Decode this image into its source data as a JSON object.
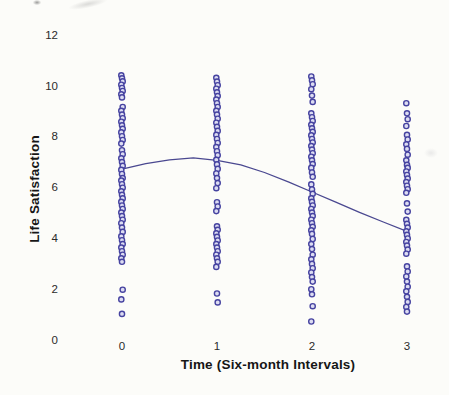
{
  "chart_data": {
    "type": "scatter",
    "title": "",
    "xlabel": "Time (Six-month Intervals)",
    "ylabel": "Life Satisfaction",
    "x_tick_labels": [
      "0",
      "1",
      "2",
      "3"
    ],
    "y_tick_labels": [
      "0",
      "2",
      "4",
      "6",
      "8",
      "10",
      "12"
    ],
    "y_tick_values": [
      0,
      2,
      4,
      6,
      8,
      10,
      12
    ],
    "x_tick_values": [
      0,
      1,
      2,
      3
    ],
    "xlim": [
      -0.35,
      3.35
    ],
    "ylim": [
      0,
      12
    ],
    "grid": false,
    "axes_lines": false,
    "legend": null,
    "series": [
      {
        "name": "observations-t0",
        "x": 0,
        "values": [
          10.45,
          10.33,
          10.21,
          10.08,
          9.95,
          9.83,
          9.7,
          9.58,
          9.2,
          9.05,
          8.9,
          8.76,
          8.62,
          8.48,
          8.34,
          8.2,
          8.05,
          7.9,
          7.76,
          7.5,
          7.34,
          7.18,
          7.03,
          6.88,
          6.72,
          6.56,
          6.4,
          6.3,
          6.16,
          6.02,
          5.88,
          5.74,
          5.6,
          5.46,
          5.32,
          5.18,
          5.04,
          4.9,
          4.76,
          4.62,
          4.45,
          4.28,
          4.1,
          3.95,
          3.8,
          3.66,
          3.52,
          3.38,
          3.24,
          3.1,
          2.0,
          1.62,
          1.05
        ]
      },
      {
        "name": "observations-t1",
        "x": 1,
        "values": [
          10.35,
          10.2,
          10.06,
          9.92,
          9.78,
          9.63,
          9.49,
          9.35,
          9.2,
          9.05,
          8.9,
          8.74,
          8.58,
          8.42,
          8.26,
          8.1,
          7.94,
          7.78,
          7.62,
          7.46,
          7.3,
          7.12,
          6.94,
          6.76,
          6.58,
          6.4,
          6.2,
          6.0,
          5.45,
          5.28,
          5.1,
          4.5,
          4.36,
          4.22,
          4.08,
          3.94,
          3.8,
          3.66,
          3.52,
          3.38,
          3.24,
          3.1,
          2.9,
          1.85,
          1.5
        ]
      },
      {
        "name": "observations-t2",
        "x": 2,
        "values": [
          10.4,
          10.25,
          10.1,
          9.9,
          9.65,
          9.4,
          8.95,
          8.8,
          8.65,
          8.5,
          8.36,
          8.22,
          8.08,
          7.94,
          7.8,
          7.66,
          7.52,
          7.38,
          7.24,
          7.1,
          6.95,
          6.8,
          6.62,
          6.45,
          6.15,
          5.95,
          5.78,
          5.6,
          5.46,
          5.32,
          5.18,
          5.04,
          4.9,
          4.76,
          4.62,
          4.48,
          4.34,
          4.2,
          4.0,
          3.8,
          3.6,
          3.38,
          3.2,
          3.02,
          2.85,
          2.68,
          2.5,
          2.32,
          2.02,
          1.82,
          1.35,
          0.75
        ]
      },
      {
        "name": "observations-t3",
        "x": 3,
        "values": [
          9.35,
          8.95,
          8.72,
          8.45,
          8.1,
          7.92,
          7.73,
          7.55,
          7.32,
          7.1,
          6.92,
          6.8,
          6.66,
          6.52,
          6.38,
          6.24,
          6.1,
          5.96,
          5.82,
          5.4,
          5.08,
          4.75,
          4.6,
          4.45,
          4.3,
          4.16,
          4.02,
          3.88,
          3.74,
          3.58,
          3.42,
          2.92,
          2.72,
          2.52,
          2.32,
          2.12,
          1.94,
          1.72,
          1.52,
          1.32,
          1.14
        ]
      }
    ],
    "fit_curve": {
      "name": "fitted-trajectory",
      "points": [
        [
          0,
          6.75
        ],
        [
          0.25,
          6.97
        ],
        [
          0.5,
          7.12
        ],
        [
          0.75,
          7.2
        ],
        [
          1,
          7.1
        ],
        [
          1.25,
          6.92
        ],
        [
          1.5,
          6.62
        ],
        [
          1.75,
          6.25
        ],
        [
          2,
          5.85
        ],
        [
          2.25,
          5.45
        ],
        [
          2.5,
          5.05
        ],
        [
          2.75,
          4.67
        ],
        [
          3,
          4.3
        ]
      ]
    },
    "colors": {
      "point_stroke": "#4643a0",
      "point_fill": "#dcdcf2",
      "curve": "#4a4890",
      "text": "#1c1c1c",
      "background": "#fcfcf9"
    }
  }
}
